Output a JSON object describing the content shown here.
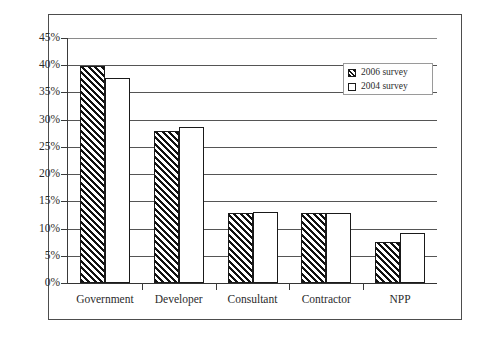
{
  "chart_data": {
    "type": "bar",
    "title": "",
    "xlabel": "",
    "ylabel": "",
    "ylim": [
      0,
      45
    ],
    "ytick_labels": [
      "0%",
      "5%",
      "10%",
      "15%",
      "20%",
      "25%",
      "30%",
      "35%",
      "40%",
      "45%"
    ],
    "ytick_values": [
      0,
      5,
      10,
      15,
      20,
      25,
      30,
      35,
      40,
      45
    ],
    "grid": true,
    "legend_position": "upper-right",
    "categories": [
      "Government",
      "Developer",
      "Consultant",
      "Contractor",
      "NPP"
    ],
    "series": [
      {
        "name": "2006 survey",
        "fill": "hatched",
        "values": [
          39.8,
          28.0,
          12.9,
          12.8,
          7.6
        ]
      },
      {
        "name": "2004 survey",
        "fill": "white",
        "values": [
          37.6,
          28.6,
          13.1,
          12.8,
          9.1
        ]
      }
    ]
  },
  "legend": {
    "items": [
      {
        "label": "2006 survey",
        "swatch": "hatched-swatch"
      },
      {
        "label": "2004 survey",
        "swatch": "white-swatch"
      }
    ]
  }
}
